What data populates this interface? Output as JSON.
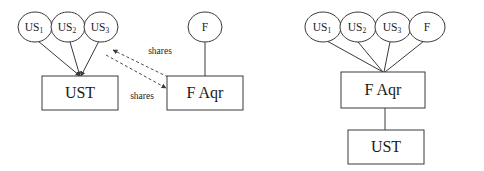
{
  "figure": {
    "kind": "two-panel-entity-relationship-diagram",
    "background_color": "#ffffff",
    "stroke_color": "#3a3a3a",
    "text_color": "#1b1b1b"
  },
  "left_panel": {
    "name": "before-restructuring",
    "circles": [
      {
        "id": "us1",
        "base": "US",
        "sub": "1",
        "cx": 35,
        "cy": 27,
        "rx": 17,
        "ry": 15
      },
      {
        "id": "us2",
        "base": "US",
        "sub": "2",
        "cx": 68,
        "cy": 27,
        "rx": 17,
        "ry": 15
      },
      {
        "id": "us3",
        "base": "US",
        "sub": "3",
        "cx": 101,
        "cy": 27,
        "rx": 17,
        "ry": 15
      },
      {
        "id": "f",
        "base": "F",
        "sub": "",
        "cx": 205,
        "cy": 27,
        "rx": 17,
        "ry": 15
      }
    ],
    "boxes": [
      {
        "id": "ust",
        "label": "UST",
        "x": 42,
        "y": 76,
        "w": 76,
        "h": 34
      },
      {
        "id": "faqr",
        "label": "F Aqr",
        "x": 167,
        "y": 76,
        "w": 76,
        "h": 34
      }
    ],
    "solid_edges": [
      {
        "from": "us1",
        "to": "ust-top",
        "x1": 38,
        "y1": 41,
        "x2": 80,
        "y2": 76
      },
      {
        "from": "us2",
        "to": "ust-top",
        "x1": 70,
        "y1": 42,
        "x2": 80,
        "y2": 76
      },
      {
        "from": "us3",
        "to": "ust-top",
        "x1": 99,
        "y1": 41,
        "x2": 81,
        "y2": 76
      },
      {
        "from": "f",
        "to": "faqr-top",
        "x1": 205,
        "y1": 42,
        "x2": 205,
        "y2": 76
      }
    ],
    "dashed_edges": [
      {
        "id": "shares-to-us3",
        "label": "shares",
        "label_x": 160,
        "label_y": 52,
        "x1": 168,
        "y1": 77,
        "x2": 113,
        "y2": 50,
        "arrow_at": "end"
      },
      {
        "id": "shares-to-faqr",
        "label": "shares",
        "label_x": 142,
        "label_y": 97,
        "x1": 106,
        "y1": 55,
        "x2": 166,
        "y2": 88,
        "arrow_at": "end"
      }
    ]
  },
  "right_panel": {
    "name": "after-restructuring",
    "circles": [
      {
        "id": "us1",
        "base": "US",
        "sub": "1",
        "cx": 323,
        "cy": 27,
        "rx": 18,
        "ry": 15
      },
      {
        "id": "us2",
        "base": "US",
        "sub": "2",
        "cx": 358,
        "cy": 27,
        "rx": 18,
        "ry": 15
      },
      {
        "id": "us3",
        "base": "US",
        "sub": "3",
        "cx": 393,
        "cy": 27,
        "rx": 18,
        "ry": 15
      },
      {
        "id": "f",
        "base": "F",
        "sub": "",
        "cx": 427,
        "cy": 27,
        "rx": 18,
        "ry": 15
      }
    ],
    "boxes": [
      {
        "id": "faqr",
        "label": "F Aqr",
        "x": 341,
        "y": 72,
        "w": 84,
        "h": 36
      },
      {
        "id": "ust",
        "label": "UST",
        "x": 348,
        "y": 130,
        "w": 76,
        "h": 34
      }
    ],
    "solid_edges": [
      {
        "from": "us1",
        "to": "faqr-top",
        "x1": 327,
        "y1": 41,
        "x2": 383,
        "y2": 72
      },
      {
        "from": "us2",
        "to": "faqr-top",
        "x1": 358,
        "y1": 42,
        "x2": 383,
        "y2": 72
      },
      {
        "from": "us3",
        "to": "faqr-top",
        "x1": 390,
        "y1": 42,
        "x2": 384,
        "y2": 72
      },
      {
        "from": "f",
        "to": "faqr-top",
        "x1": 424,
        "y1": 41,
        "x2": 385,
        "y2": 72
      },
      {
        "from": "faqr-bottom",
        "to": "ust-top",
        "x1": 385,
        "y1": 108,
        "x2": 385,
        "y2": 130
      }
    ]
  }
}
